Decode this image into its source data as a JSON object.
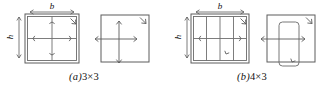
{
  "figure": {
    "background_color": "#ffffff",
    "line_color": "#5c5c5c",
    "text_color": "#111111"
  },
  "panels": [
    {
      "id": "a",
      "caption_letter": "(a)",
      "caption_text": "3×3",
      "dimension_labels": {
        "width": "b",
        "height": "h"
      },
      "plan_view": {
        "name": "plan-view-3x3",
        "columns": 3,
        "rows": 3,
        "vertical_dividers": 1,
        "horizontal_dividers": 1,
        "has_outer_tie": true,
        "has_inner_tie": true
      },
      "section_view": {
        "name": "section-view-3x3",
        "inner_shape": "none",
        "cross_bars": 2,
        "arrow_ends": 4
      }
    },
    {
      "id": "b",
      "caption_letter": "(b)",
      "caption_text": "4×3",
      "dimension_labels": {
        "width": "b",
        "height": "h"
      },
      "plan_view": {
        "name": "plan-view-4x3",
        "columns": 4,
        "rows": 3,
        "vertical_dividers": 3,
        "horizontal_dividers": 1,
        "has_outer_tie": true,
        "has_inner_tie": true
      },
      "section_view": {
        "name": "section-view-4x3",
        "inner_shape": "rounded-rectangle",
        "cross_bars": 1,
        "arrow_ends": 2
      }
    }
  ]
}
